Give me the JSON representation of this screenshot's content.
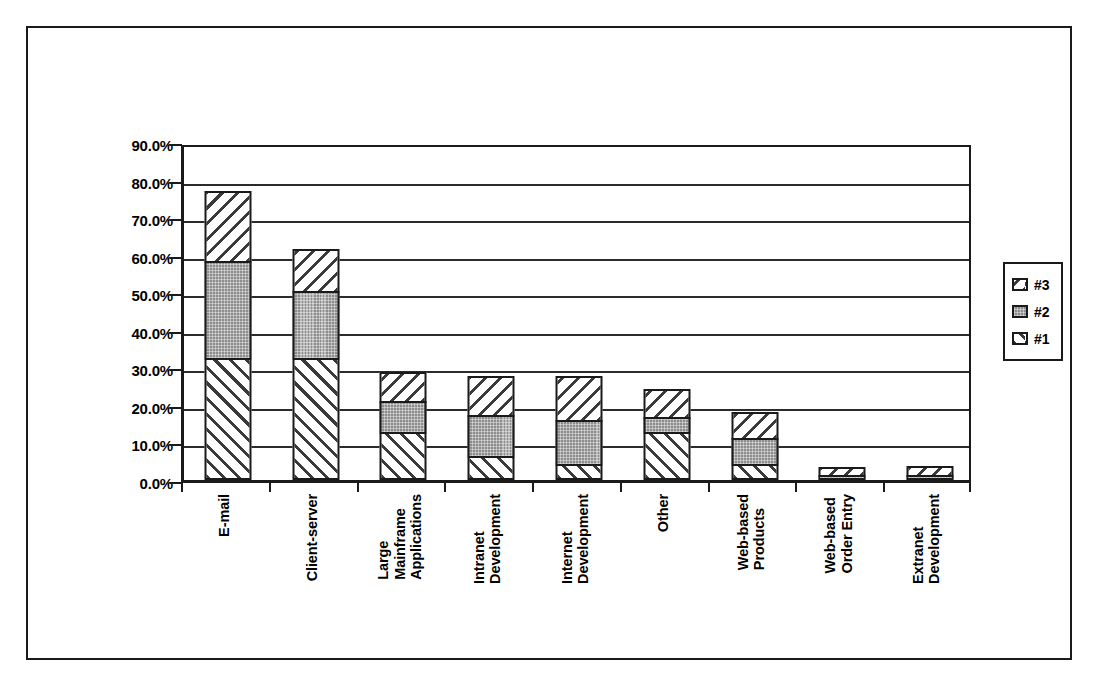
{
  "chart_data": {
    "type": "bar",
    "subtype": "stacked-bar",
    "title": "",
    "xlabel": "",
    "ylabel": "",
    "ylim": [
      0,
      90
    ],
    "ytick_labels": [
      "90.0%",
      "80.0%",
      "70.0%",
      "60.0%",
      "50.0%",
      "40.0%",
      "30.0%",
      "20.0%",
      "10.0%",
      "0.0%"
    ],
    "ytick_values": [
      90,
      80,
      70,
      60,
      50,
      40,
      30,
      20,
      10,
      0
    ],
    "grid": true,
    "legend_position": "right",
    "categories": [
      "E-mail",
      "Client-server",
      "Large Mainframe Applications",
      "Intranet Development",
      "Internet Development",
      "Other",
      "Web-based Products",
      "Web-based Order Entry",
      "Extranet Development"
    ],
    "category_lines": [
      [
        "E-mail"
      ],
      [
        "Client-server"
      ],
      [
        "Large",
        "Mainframe",
        "Applications"
      ],
      [
        "Intranet",
        "Development"
      ],
      [
        "Internet",
        "Development"
      ],
      [
        "Other"
      ],
      [
        "Web-based",
        "Products"
      ],
      [
        "Web-based",
        "Order Entry"
      ],
      [
        "Extranet",
        "Development"
      ]
    ],
    "series": [
      {
        "name": "#1",
        "fill": "fill-1",
        "values": [
          32.4,
          32.4,
          12.9,
          6.5,
          4.3,
          12.9,
          4.3,
          0.0,
          0.0
        ]
      },
      {
        "name": "#2",
        "fill": "fill-2",
        "values": [
          26.5,
          18.5,
          8.6,
          11.4,
          12.2,
          4.3,
          7.5,
          1.2,
          1.1
        ]
      },
      {
        "name": "#3",
        "fill": "fill-3",
        "values": [
          19.0,
          11.6,
          8.3,
          10.8,
          12.2,
          8.1,
          7.5,
          2.8,
          2.9
        ]
      }
    ],
    "totals": [
      77.9,
      62.5,
      29.8,
      28.7,
      28.7,
      25.3,
      19.3,
      4.0,
      4.0
    ]
  },
  "legend": {
    "items": [
      {
        "label": "#3",
        "fill": "fill-3"
      },
      {
        "label": "#2",
        "fill": "fill-2"
      },
      {
        "label": "#1",
        "fill": "fill-1"
      }
    ]
  },
  "colors": {
    "axis": "#1a1a1a",
    "grid": "#2b2b2b",
    "series_2_fill": "#8d8d8d",
    "hatch": "#3a3a3a",
    "background": "#ffffff"
  }
}
